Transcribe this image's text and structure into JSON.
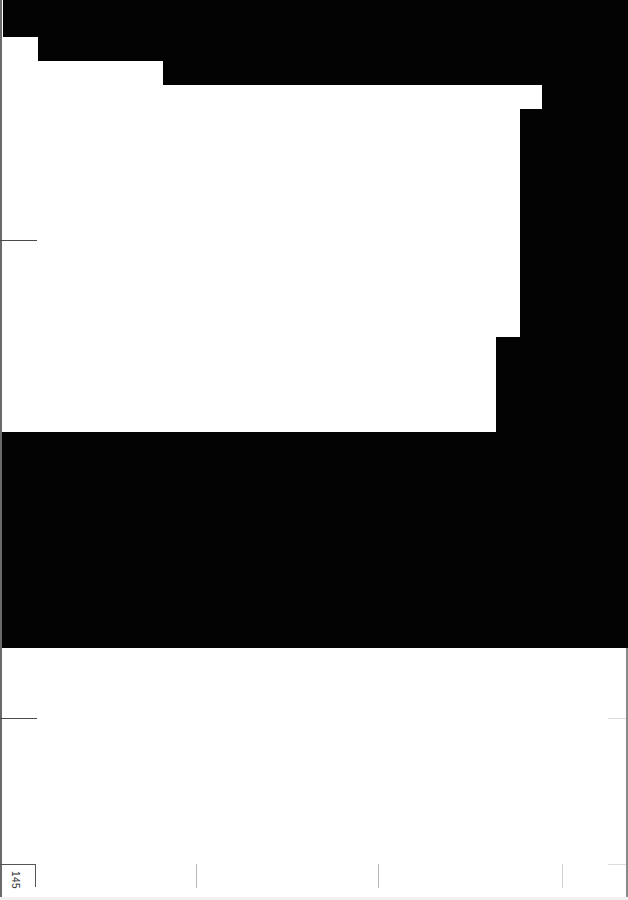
{
  "page": {
    "type": "scanned-book-page",
    "page_number": "145",
    "page_number_orientation": "rotated-90-clockwise"
  },
  "colors": {
    "paper": "#ffffff",
    "black_region": "#030303",
    "crop_marks": "#4a4a4a",
    "ticks": "#b8b8b8"
  },
  "regions": {
    "top_black_steps": [
      {
        "x": 3,
        "y": 0,
        "w": 625,
        "h": 37
      },
      {
        "x": 38,
        "y": 37,
        "w": 590,
        "h": 24
      },
      {
        "x": 163,
        "y": 61,
        "w": 465,
        "h": 24
      }
    ],
    "right_black_column": [
      {
        "x": 542,
        "y": 85,
        "w": 86,
        "h": 24
      },
      {
        "x": 520,
        "y": 109,
        "w": 108,
        "h": 228
      },
      {
        "x": 496,
        "y": 337,
        "w": 132,
        "h": 95
      }
    ],
    "middle_black_band": {
      "x": 0,
      "y": 432,
      "w": 628,
      "h": 216
    }
  },
  "marks": {
    "left_crop_marks_y": [
      240,
      718
    ],
    "bottom_ticks_x": [
      196,
      378,
      562
    ]
  }
}
